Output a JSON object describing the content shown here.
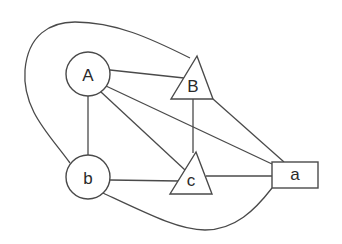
{
  "diagram": {
    "type": "graph",
    "nodes": [
      {
        "id": "A",
        "label": "A",
        "shape": "circle"
      },
      {
        "id": "b",
        "label": "b",
        "shape": "circle"
      },
      {
        "id": "B",
        "label": "B",
        "shape": "triangle"
      },
      {
        "id": "c",
        "label": "c",
        "shape": "triangle"
      },
      {
        "id": "a",
        "label": "a",
        "shape": "rectangle"
      }
    ],
    "edges": [
      {
        "from": "A",
        "to": "B"
      },
      {
        "from": "A",
        "to": "a"
      },
      {
        "from": "A",
        "to": "c"
      },
      {
        "from": "A",
        "to": "b"
      },
      {
        "from": "B",
        "to": "c"
      },
      {
        "from": "B",
        "to": "a"
      },
      {
        "from": "b",
        "to": "c"
      },
      {
        "from": "c",
        "to": "a"
      },
      {
        "from": "b",
        "to": "a",
        "style": "curved-bottom"
      },
      {
        "from": "b",
        "to": "B",
        "style": "curved-around-top-left"
      }
    ],
    "colors": {
      "stroke": "#4a4a4a",
      "text": "#2a2a2a",
      "background": "#ffffff"
    }
  }
}
